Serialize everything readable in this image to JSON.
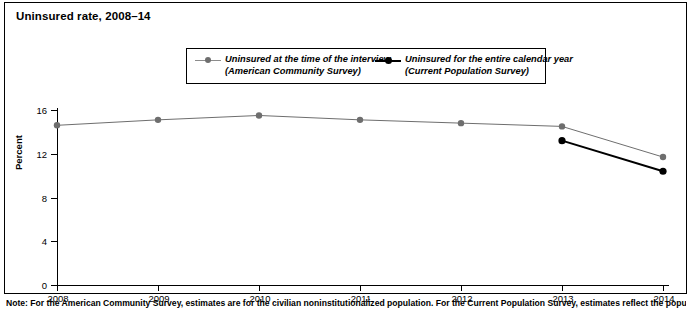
{
  "figure": {
    "title": "Uninsured rate, 2008–14",
    "note": "Note: For the American Community Survey, estimates are for the civilian noninstitutionalized population. For the Current Population Survey, estimates reflect the population as of"
  },
  "chart_data": {
    "type": "line",
    "title": "Uninsured rate, 2008–14",
    "xlabel": "",
    "ylabel": "Percent",
    "categories": [
      "2008",
      "2009",
      "2010",
      "2011",
      "2012",
      "2013",
      "2014"
    ],
    "x": [
      2008,
      2009,
      2010,
      2011,
      2012,
      2013,
      2014
    ],
    "ylim": [
      0,
      16
    ],
    "yticks": [
      0,
      4,
      8,
      12,
      16
    ],
    "ytick_labels": [
      "0",
      "4",
      "8",
      "12",
      "16"
    ],
    "grid": false,
    "legend_position": "top-center",
    "series": [
      {
        "name": "Uninsured at the time of the interview",
        "source": "(American Community Survey)",
        "color": "#6e6e6e",
        "line_width": 1,
        "values": [
          14.6,
          15.1,
          15.5,
          15.1,
          14.8,
          14.5,
          11.7
        ]
      },
      {
        "name": "Uninsured for the entire calendar year",
        "source": "(Current Population Survey)",
        "color": "#000000",
        "line_width": 2,
        "values": [
          null,
          null,
          null,
          null,
          null,
          13.2,
          10.4
        ]
      }
    ]
  },
  "legend": {
    "entries": [
      {
        "label_line1": "Uninsured at the time of the interview",
        "label_line2": "(American Community Survey)"
      },
      {
        "label_line1": "Uninsured for the entire calendar year",
        "label_line2": "(Current Population Survey)"
      }
    ]
  }
}
